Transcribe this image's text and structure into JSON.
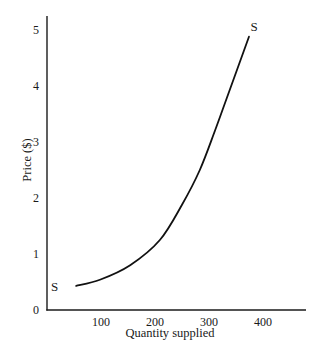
{
  "chart_data": {
    "type": "line",
    "title": "",
    "xlabel": "Quantity supplied",
    "ylabel": "Price ($)",
    "xlim": [
      0,
      480
    ],
    "ylim": [
      0,
      5.2
    ],
    "xticks": [
      100,
      200,
      300,
      400
    ],
    "xtick_labels": [
      "100",
      "200",
      "300",
      "400"
    ],
    "yticks": [
      0,
      1,
      2,
      3,
      4,
      5
    ],
    "ytick_labels": [
      "0",
      "1",
      "2",
      "3",
      "4",
      "5"
    ],
    "grid": false,
    "legend": null,
    "series": [
      {
        "name": "S",
        "x": [
          54,
          98,
          154,
          209,
          250,
          283,
          311,
          335,
          374
        ],
        "y": [
          0.43,
          0.54,
          0.8,
          1.25,
          1.88,
          2.5,
          3.2,
          3.84,
          4.88
        ]
      }
    ],
    "annotations": [
      {
        "text": "S",
        "x": 40,
        "y": 0.43,
        "position": "curve start"
      },
      {
        "text": "S",
        "x": 380,
        "y": 5.05,
        "position": "curve end"
      }
    ]
  }
}
